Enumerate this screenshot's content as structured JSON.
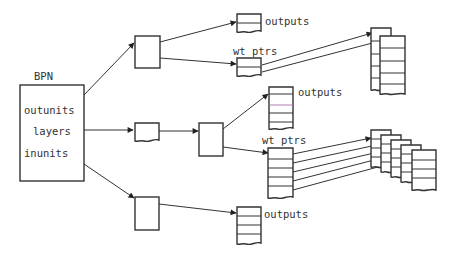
{
  "diagram": {
    "title": "BPN",
    "colors": {
      "stroke": "#333333",
      "text": "#333333",
      "highlight_row": "#b07ab0",
      "background": "#ffffff"
    },
    "root": {
      "label": "BPN",
      "fields": [
        "outunits",
        "layers",
        "inunits"
      ]
    },
    "top_branch": {
      "outputs_label": "outputs",
      "wt_ptrs_label": "wt ptrs"
    },
    "middle_branch": {
      "outputs_label": "outputs",
      "wt_ptrs_label": "wt ptrs"
    },
    "bottom_branch": {
      "outputs_label": "outputs"
    }
  }
}
